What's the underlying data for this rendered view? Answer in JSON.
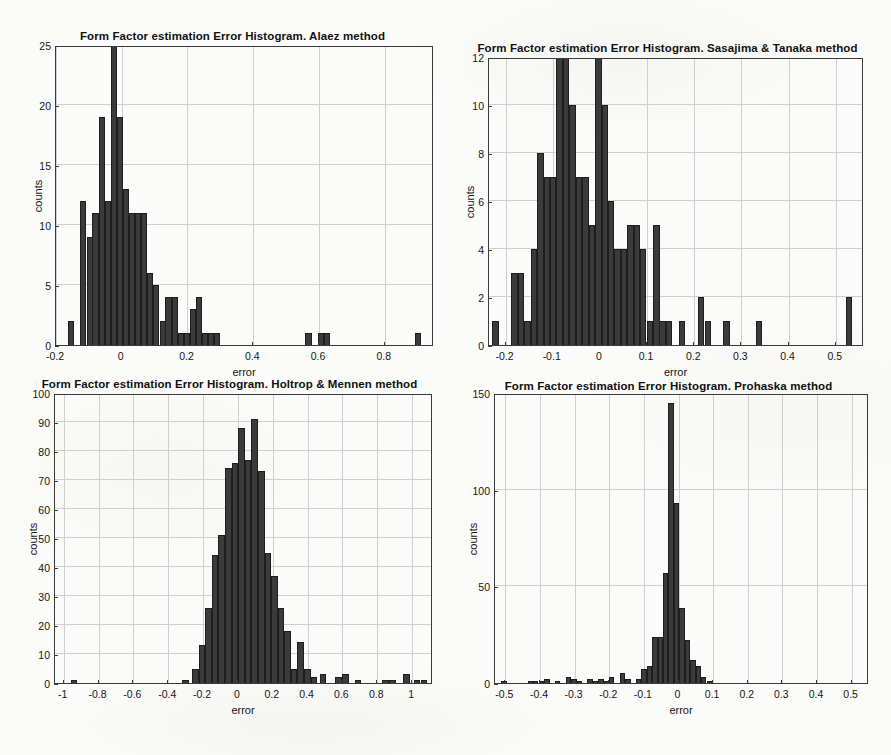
{
  "figure": {
    "layout": "2x2 grid of histograms",
    "panel_count": 4
  },
  "chart_data": [
    {
      "id": "alaez",
      "type": "bar",
      "title": "Form Factor estimation Error Histogram. Alaez method",
      "xlabel": "error",
      "ylabel": "counts",
      "xlim": [
        -0.2,
        0.95
      ],
      "ylim": [
        0,
        25
      ],
      "xticks": [
        -0.2,
        0,
        0.2,
        0.4,
        0.6,
        0.8
      ],
      "xticklabels": [
        "-0.2",
        "0",
        "0.2",
        "0.4",
        "0.6",
        "0.8"
      ],
      "yticks": [
        0,
        5,
        10,
        15,
        20,
        25
      ],
      "yticklabels": [
        "0",
        "5",
        "10",
        "15",
        "20",
        "25"
      ],
      "grid": true,
      "bin_width": 0.0185,
      "bin_left_edges": [
        -0.163,
        -0.144,
        -0.126,
        -0.107,
        -0.089,
        -0.07,
        -0.052,
        -0.033,
        -0.015,
        0.004,
        0.022,
        0.041,
        0.059,
        0.078,
        0.096,
        0.115,
        0.133,
        0.152,
        0.17,
        0.189,
        0.207,
        0.226,
        0.244,
        0.263,
        0.281,
        0.3,
        0.318,
        0.337,
        0.355,
        0.374,
        0.559,
        0.596,
        0.615,
        0.892
      ],
      "values": [
        2,
        0,
        12,
        9,
        11,
        19,
        12,
        25,
        19,
        13,
        11,
        11,
        6,
        5,
        2,
        4,
        4,
        1,
        1,
        3,
        4,
        1,
        1,
        1,
        0,
        0,
        1,
        1,
        1,
        1
      ]
    },
    {
      "id": "sasajima-tanaka",
      "type": "bar",
      "title": "Form Factor estimation Error Histogram. Sasajima & Tanaka method",
      "xlabel": "error",
      "ylabel": "counts",
      "xlim": [
        -0.235,
        0.56
      ],
      "ylim": [
        0,
        12
      ],
      "xticks": [
        -0.2,
        -0.1,
        0,
        0.1,
        0.2,
        0.3,
        0.4,
        0.5
      ],
      "xticklabels": [
        "-0.2",
        "-0.1",
        "0",
        "0.1",
        "0.2",
        "0.3",
        "0.4",
        "0.5"
      ],
      "yticks": [
        0,
        2,
        4,
        6,
        8,
        10,
        12
      ],
      "yticklabels": [
        "0",
        "2",
        "4",
        "6",
        "8",
        "10",
        "12"
      ],
      "grid": true,
      "bin_width": 0.0135,
      "values": [
        1,
        0,
        3,
        3,
        1,
        4,
        8,
        7,
        7,
        12,
        10,
        7,
        7,
        5,
        12,
        10,
        6,
        4,
        4,
        5,
        5,
        4,
        1,
        5,
        1,
        1,
        0,
        1,
        0,
        2,
        1,
        0,
        1,
        0,
        1,
        0,
        0,
        0,
        0,
        2
      ]
    },
    {
      "id": "holtrop-mennen",
      "type": "bar",
      "title": "Form Factor estimation Error Histogram. Holtrop & Mennen method",
      "xlabel": "error",
      "ylabel": "counts",
      "xlim": [
        -1.05,
        1.12
      ],
      "ylim": [
        0,
        100
      ],
      "xticks": [
        -1,
        -0.8,
        -0.6,
        -0.4,
        -0.2,
        0,
        0.2,
        0.4,
        0.6,
        0.8,
        1
      ],
      "xticklabels": [
        "-1",
        "-0.8",
        "-0.6",
        "-0.4",
        "-0.2",
        "0",
        "0.2",
        "0.4",
        "0.6",
        "0.8",
        "1"
      ],
      "yticks": [
        0,
        10,
        20,
        30,
        40,
        50,
        60,
        70,
        80,
        90,
        100
      ],
      "yticklabels": [
        "0",
        "10",
        "20",
        "30",
        "40",
        "50",
        "60",
        "70",
        "80",
        "90",
        "100"
      ],
      "grid": true,
      "bin_width": 0.0375,
      "bin_starts": [
        -0.96,
        -0.32,
        -0.26
      ],
      "main_bins_start": -0.263,
      "values": [
        5,
        13,
        26,
        44,
        51,
        74,
        76,
        88,
        77,
        91,
        73,
        45,
        37,
        26,
        18,
        5,
        14,
        5,
        2
      ],
      "outliers": [
        {
          "x": -0.96,
          "count": 1
        },
        {
          "x": -0.32,
          "count": 1
        },
        {
          "x": 0.47,
          "count": 3
        },
        {
          "x": 0.56,
          "count": 2
        },
        {
          "x": 0.6,
          "count": 3
        },
        {
          "x": 0.67,
          "count": 1
        },
        {
          "x": 0.83,
          "count": 1
        },
        {
          "x": 0.87,
          "count": 1
        },
        {
          "x": 0.95,
          "count": 3
        },
        {
          "x": 1.01,
          "count": 1
        },
        {
          "x": 1.05,
          "count": 1
        }
      ]
    },
    {
      "id": "prohaska",
      "type": "bar",
      "title": "Form Factor estimation Error Histogram. Prohaska method",
      "xlabel": "error",
      "ylabel": "counts",
      "xlim": [
        -0.53,
        0.55
      ],
      "ylim": [
        0,
        150
      ],
      "xticks": [
        -0.5,
        -0.4,
        -0.3,
        -0.2,
        -0.1,
        0,
        0.1,
        0.2,
        0.3,
        0.4,
        0.5
      ],
      "xticklabels": [
        "-0.5",
        "-0.4",
        "-0.3",
        "-0.2",
        "-0.1",
        "0",
        "0.1",
        "0.2",
        "0.3",
        "0.4",
        "0.5"
      ],
      "yticks": [
        0,
        50,
        100,
        150
      ],
      "yticklabels": [
        "0",
        "50",
        "100",
        "150"
      ],
      "grid": true,
      "bin_width": 0.0155,
      "values": [
        1,
        0,
        0,
        1,
        1,
        1,
        2,
        1,
        3,
        2,
        2,
        1,
        2,
        0,
        3,
        5,
        2,
        2,
        7,
        9,
        24,
        24,
        57,
        145,
        93,
        39,
        22,
        12,
        9,
        3,
        0,
        0
      ],
      "peak_value": 145
    }
  ]
}
